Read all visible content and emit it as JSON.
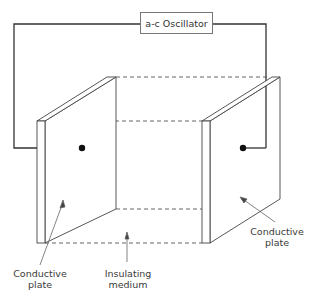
{
  "diagram": {
    "oscillator": {
      "label": "a-c Oscillator"
    },
    "labels": {
      "left_plate": [
        "Conductive",
        "plate"
      ],
      "right_plate": [
        "Conductive",
        "plate"
      ],
      "medium": [
        "Insulating",
        "medium"
      ]
    },
    "components": [
      {
        "id": "oscillator",
        "type": "source",
        "label": "a-c Oscillator"
      },
      {
        "id": "left-plate",
        "type": "electrode",
        "label": "Conductive plate"
      },
      {
        "id": "right-plate",
        "type": "electrode",
        "label": "Conductive plate"
      },
      {
        "id": "medium",
        "type": "dielectric",
        "label": "Insulating medium"
      }
    ],
    "connections": [
      {
        "from": "oscillator",
        "to": "left-plate"
      },
      {
        "from": "oscillator",
        "to": "right-plate"
      }
    ],
    "colors": {
      "line": "#333333",
      "thin_line": "#555555",
      "background": "#ffffff"
    }
  }
}
